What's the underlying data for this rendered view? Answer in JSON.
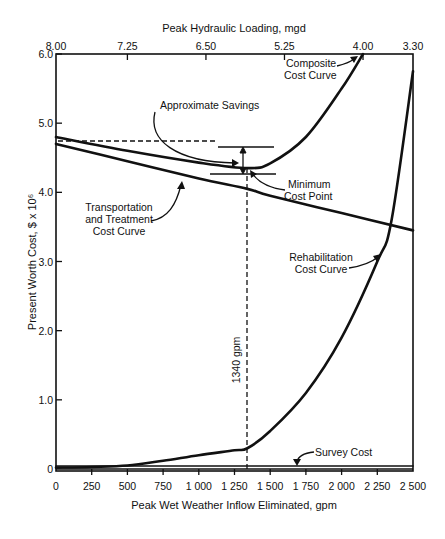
{
  "chart_data": {
    "type": "line",
    "title": "",
    "xlabel": "Peak Wet Weather Inflow Eliminated, gpm",
    "ylabel": "Present Worth Cost, $ x 10⁶",
    "top_xlabel": "Peak Hydraulic Loading, mgd",
    "xlim": [
      0,
      2500
    ],
    "ylim": [
      0,
      6.0
    ],
    "grid": false,
    "x_ticks": [
      "0",
      "250",
      "500",
      "750",
      "1 000",
      "1 250",
      "1 500",
      "1 750",
      "2 000",
      "2 250",
      "2 500"
    ],
    "x_tick_values": [
      0,
      250,
      500,
      750,
      1000,
      1250,
      1500,
      1750,
      2000,
      2250,
      2500
    ],
    "y_ticks": [
      "0",
      "1.0",
      "2.0",
      "3.0",
      "4.0",
      "5.0",
      "6.0"
    ],
    "y_tick_values": [
      0,
      1.0,
      2.0,
      3.0,
      4.0,
      5.0,
      6.0
    ],
    "top_x_ticks": [
      "8.00",
      "7.25",
      "6.50",
      "5.25",
      "4.00",
      "3.30"
    ],
    "top_x_tick_positions_gpm": [
      0,
      500,
      1050,
      1600,
      2150,
      2500
    ],
    "series": [
      {
        "name": "Transportation and Treatment Cost Curve",
        "x": [
          0,
          500,
          1000,
          1340,
          1500,
          2000,
          2500
        ],
        "y": [
          4.7,
          4.45,
          4.2,
          4.05,
          3.95,
          3.7,
          3.45
        ]
      },
      {
        "name": "Rehabilitation Cost Curve",
        "x": [
          0,
          250,
          500,
          750,
          1000,
          1250,
          1340,
          1500,
          1750,
          2000,
          2250,
          2350,
          2500
        ],
        "y": [
          0.02,
          0.03,
          0.05,
          0.12,
          0.2,
          0.27,
          0.3,
          0.55,
          1.1,
          1.9,
          3.0,
          3.6,
          5.75
        ]
      },
      {
        "name": "Composite Cost Curve",
        "x": [
          0,
          500,
          1000,
          1340,
          1500,
          1750,
          2000,
          2150
        ],
        "y": [
          4.8,
          4.6,
          4.43,
          4.35,
          4.42,
          4.8,
          5.5,
          6.0
        ]
      },
      {
        "name": "Survey Cost",
        "x": [
          0,
          2500
        ],
        "y": [
          0.05,
          0.05
        ]
      }
    ],
    "annotations": [
      {
        "text": "Composite Cost Curve",
        "points_to": "Composite Cost Curve near 2150 gpm"
      },
      {
        "text": "Approximate Savings",
        "points_to": "gap between 4.75 and 4.35 at 1340 gpm"
      },
      {
        "text": "Minimum Cost Point",
        "points_to": "Composite minimum at 1340 gpm, 4.35"
      },
      {
        "text": "Transportation and Treatment Cost Curve",
        "points_to": "Transportation line"
      },
      {
        "text": "Rehabilitation Cost Curve",
        "points_to": "Rehabilitation curve near 2350 gpm"
      },
      {
        "text": "Survey Cost",
        "points_to": "Survey cost line near 1700 gpm"
      },
      {
        "text": "1340 gpm",
        "points_to": "dashed vertical line at 1340 gpm"
      }
    ],
    "reference_lines": {
      "dashed_vertical_x": 1340,
      "dashed_horizontal_y": 4.75,
      "savings_upper": 4.75,
      "savings_lower": 4.35
    }
  },
  "labels": {
    "top_axis_title": "Peak Hydraulic Loading, mgd",
    "bottom_axis_title": "Peak Wet Weather Inflow Eliminated, gpm",
    "y_axis_title": "Present Worth Cost, $ x 10⁶",
    "composite_1": "Composite",
    "composite_2": "Cost Curve",
    "savings": "Approximate Savings",
    "mincost_1": "Minimum",
    "mincost_2": "Cost Point",
    "transport_1": "Transportation",
    "transport_2": "and Treatment",
    "transport_3": "Cost Curve",
    "rehab_1": "Rehabilitation",
    "rehab_2": "Cost Curve",
    "survey": "Survey Cost",
    "gpm1340": "1340 gpm"
  }
}
